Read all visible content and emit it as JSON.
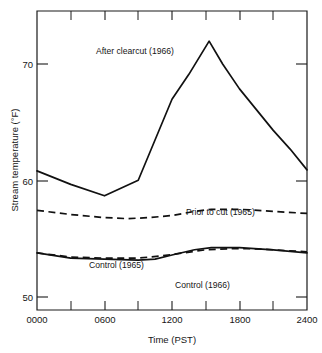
{
  "chart_data": {
    "type": "line",
    "title": "",
    "xlabel": "Time  (PST)",
    "ylabel": "Stream temperature  (°F)",
    "xlim": [
      0,
      2400
    ],
    "ylim": [
      46.9,
      75.7
    ],
    "grid": false,
    "legend_position": "inline-annotations",
    "x_ticks_major": [
      0,
      600,
      1200,
      1800,
      2400
    ],
    "x_tick_labels": [
      "0000",
      "0600",
      "1200",
      "1800",
      "2400"
    ],
    "x_ticks_minor": [
      300,
      900,
      1500,
      2100
    ],
    "y_ticks_major": [
      50,
      60,
      70
    ],
    "y_tick_labels": [
      "50",
      "60",
      "70"
    ],
    "series": [
      {
        "name": "After clearcut (1966)",
        "style": "solid",
        "label_x": 700,
        "label_y": 71.0,
        "x": [
          0,
          300,
          600,
          900,
          1050,
          1200,
          1350,
          1530,
          1650,
          1800,
          2100,
          2250,
          2400
        ],
        "values": [
          60.3,
          59.0,
          57.9,
          59.4,
          63.3,
          67.2,
          69.6,
          72.8,
          70.6,
          68.2,
          64.2,
          62.4,
          60.4
        ]
      },
      {
        "name": "Prior to cut (1965)",
        "style": "dashed",
        "label_x": 1560,
        "label_y": 57.8,
        "x": [
          0,
          300,
          600,
          800,
          1000,
          1200,
          1400,
          1550,
          1800,
          2100,
          2400
        ],
        "values": [
          56.5,
          56.1,
          55.8,
          55.7,
          55.8,
          56.0,
          56.4,
          56.6,
          56.6,
          56.4,
          56.2
        ]
      },
      {
        "name": "Control (1965)",
        "style": "dashed",
        "label_x": 570,
        "label_y": 53.6,
        "x": [
          0,
          300,
          600,
          900,
          1100,
          1300,
          1500,
          1700,
          1900,
          2100,
          2400
        ],
        "values": [
          52.4,
          52.0,
          51.9,
          51.9,
          52.1,
          52.4,
          52.7,
          52.8,
          52.8,
          52.7,
          52.5
        ]
      },
      {
        "name": "Control (1966)",
        "style": "solid",
        "label_x": 1330,
        "label_y": 52.2,
        "x": [
          0,
          300,
          600,
          900,
          1050,
          1200,
          1400,
          1550,
          1800,
          2100,
          2400
        ],
        "values": [
          52.4,
          51.9,
          51.8,
          51.7,
          51.8,
          52.2,
          52.7,
          52.9,
          52.9,
          52.7,
          52.4
        ]
      }
    ]
  },
  "axes": {
    "x_title": "Time  (PST)",
    "y_title": "Stream temperature  (°F)",
    "x_labels": [
      "0000",
      "0600",
      "1200",
      "1800",
      "2400"
    ],
    "y_labels": [
      "50",
      "60",
      "70"
    ]
  },
  "annotations": {
    "after_clearcut": "After clearcut (1966)",
    "prior_to_cut": "Prior to cut (1965)",
    "control_1965": "Control (1965)",
    "control_1966": "Control (1966)"
  },
  "colors": {
    "ink": "#111111",
    "background": "#ffffff"
  }
}
